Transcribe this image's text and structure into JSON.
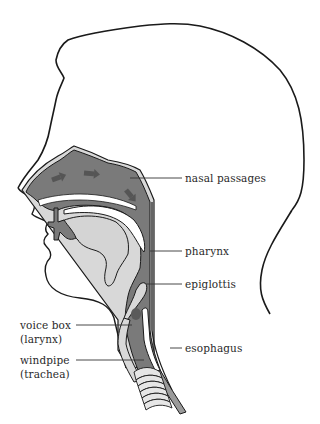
{
  "diagram": {
    "colors": {
      "outline": "#1a1a1a",
      "passage_fill": "#7a7a7a",
      "passage_rim": "#d8d8d8",
      "tongue_fill": "#d4d4d4",
      "arrow_fill": "#555555",
      "ring_fill": "#e6e6e6",
      "esophagus_fill": "#9a9a9a",
      "label_text": "#2a2a2a",
      "leader_line": "#333333",
      "background": "#ffffff"
    },
    "labels": {
      "nasal_passages": "nasal passages",
      "pharynx": "pharynx",
      "epiglottis": "epiglottis",
      "voice_box_line1": "voice box",
      "voice_box_line2": "(larynx)",
      "esophagus": "esophagus",
      "windpipe_line1": "windpipe",
      "windpipe_line2": "(trachea)"
    },
    "arrows": [
      {
        "name": "arrow-nasal-1",
        "direction": "up-right"
      },
      {
        "name": "arrow-nasal-2",
        "direction": "right"
      },
      {
        "name": "arrow-nasal-3",
        "direction": "down-right"
      }
    ]
  }
}
